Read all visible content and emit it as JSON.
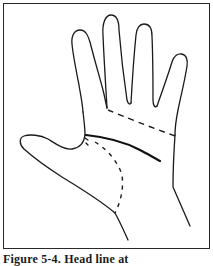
{
  "figure": {
    "caption": "Figure 5-4. Head line at",
    "frame": {
      "stroke": "#2a2a2a"
    },
    "drawing": {
      "subject": "palm-of-hand",
      "outline_color": "#1a1a1a",
      "lines": [
        {
          "name": "heart-line",
          "style": "dashed"
        },
        {
          "name": "head-line",
          "style": "solid-bold"
        },
        {
          "name": "life-line",
          "style": "dashed"
        }
      ]
    }
  }
}
